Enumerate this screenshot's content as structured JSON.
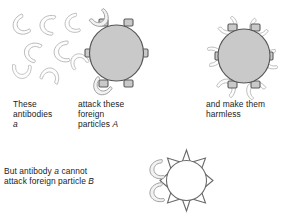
{
  "figure": {
    "background_color": "#ffffff",
    "ink_color": "#1b1b1b",
    "particle_fill_a": "#c9c9c9",
    "particle_fill_b": "#ffffff",
    "outline_color": "#585858",
    "antibody_outline_color": "#b8b8b8"
  },
  "captions": {
    "col1_line1": "These",
    "col1_line2": "antibodies",
    "col1_line3_italic": "a",
    "col2_line1": "attack these",
    "col2_line2": "foreign",
    "col2_line3_prefix": "particles ",
    "col2_line3_italic": "A",
    "col3_line1": "and make them",
    "col3_line2": "harmless",
    "bottom_line1_prefix": "But antibody ",
    "bottom_line1_italic": "a",
    "bottom_line1_suffix": " cannot",
    "bottom_line2_prefix": "attack foreign particle ",
    "bottom_line2_italic": "B"
  },
  "panels": [
    {
      "name": "free-antibodies",
      "label": "These antibodies a",
      "antibody_count": 8,
      "antibody_shape": "crescent"
    },
    {
      "name": "foreign-particle-a",
      "label": "attack these foreign particles A",
      "particle_label": "A",
      "receptor_shape": "square-tab",
      "receptor_count": 6,
      "antibodies_attached": 2,
      "fill": "#c9c9c9"
    },
    {
      "name": "neutralized-particle-a",
      "label": "and make them harmless",
      "particle_label": "A",
      "receptor_shape": "square-tab",
      "receptor_count": 6,
      "antibodies_attached": 6,
      "fill": "#c9c9c9"
    },
    {
      "name": "foreign-particle-b",
      "label": "But antibody a cannot attack foreign particle B",
      "particle_label": "B",
      "receptor_shape": "pointed-spike",
      "receptor_count": 6,
      "antibodies_attached": 0,
      "antibodies_rejected": 2,
      "fill": "#ffffff"
    }
  ]
}
